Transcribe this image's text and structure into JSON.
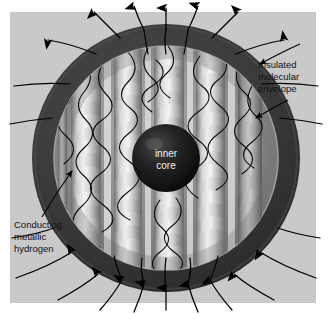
{
  "figure": {
    "type": "cutaway-diagram",
    "background_color": "#ffffff",
    "canvas_color": "#c9c9c9",
    "canvas": {
      "x": 10,
      "y": 12,
      "width": 306,
      "height": 291
    }
  },
  "labels": {
    "envelope": {
      "lines": [
        "Insulated",
        "molecular",
        "envelope"
      ],
      "line1": "Insulated",
      "line2": "molecular",
      "line3": "envelope",
      "x": 258,
      "y": 66
    },
    "metallic": {
      "lines": [
        "Conducting",
        "metallic",
        "hydrogen"
      ],
      "line1": "Conducting",
      "line2": "metallic",
      "line3": "hydrogen",
      "x": 14,
      "y": 231
    },
    "core": {
      "lines": [
        "inner",
        "core"
      ],
      "line1": "inner",
      "line2": "core",
      "x": 166,
      "y": 160
    }
  },
  "regions": [
    {
      "name": "outer-space-background",
      "color": "#c9c9c9"
    },
    {
      "name": "insulated-molecular-envelope",
      "color": "#3a3a3a",
      "radius_outer": 134,
      "radius_inner": 112
    },
    {
      "name": "conducting-metallic-hydrogen",
      "color": "#8e8e8e",
      "radius": 112
    },
    {
      "name": "inner-core",
      "color": "#151515",
      "radius": 34
    }
  ],
  "geometry": {
    "center_x": 166,
    "center_y": 158,
    "helix_columns": 5,
    "field_line_count": 22
  },
  "colors": {
    "canvas": "#c9c9c9",
    "envelope_shell": "#3a3a3a",
    "metallic_zone": "#8f8f8f",
    "core": "#141414",
    "field_line": "#000000",
    "label_text": "#111111",
    "core_text": "#f2f2f2",
    "cylinder_light": "#e8e8e8",
    "cylinder_mid": "#b5b5b5",
    "cylinder_dark": "#6a6a6a"
  }
}
